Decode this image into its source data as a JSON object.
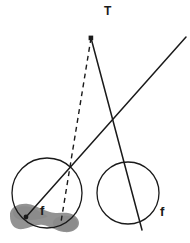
{
  "figure": {
    "width": 190,
    "height": 243,
    "background_color": "#ffffff",
    "stroke_color": "#1a1a1a",
    "blob_fill_color": "#8a8a8a",
    "labels": {
      "apex_label": "T",
      "focus_left_label": "f",
      "focus_right_label": "f"
    },
    "geometry": {
      "apex_point": {
        "x": 91,
        "y": 38
      },
      "focus_point_left": {
        "x": 26,
        "y": 217
      },
      "circle_left": {
        "cx": 47,
        "cy": 193,
        "r": 35
      },
      "circle_right": {
        "cx": 128,
        "cy": 193,
        "r": 31
      },
      "solid_line_from_apex": {
        "x1": 91,
        "y1": 38,
        "x2": 142,
        "y2": 230
      },
      "solid_line_diagonal": {
        "x1": 26,
        "y1": 217,
        "x2": 186,
        "y2": 37
      },
      "dashed_line": {
        "x1": 91,
        "y1": 38,
        "x2": 61,
        "y2": 222
      },
      "lines_crossing_point": {
        "x": 115,
        "y": 118
      }
    }
  }
}
